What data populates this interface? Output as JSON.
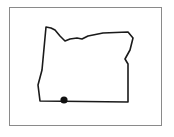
{
  "map": {
    "region": "Oregon",
    "outline_color": "#1a1a1a",
    "frame_color": "#8a8a8a",
    "marker": {
      "label": "location-marker",
      "color": "#111111",
      "x": 64,
      "y": 100,
      "r": 3.6
    },
    "outline_points": "46,27 51,28 55,30 60,36 65,41 70,39 77,38 82,39 88,36 103,33 128,32 133,38 130,50 125,59 128,64 128,102 40,101 38,85 42,70 46,27"
  }
}
